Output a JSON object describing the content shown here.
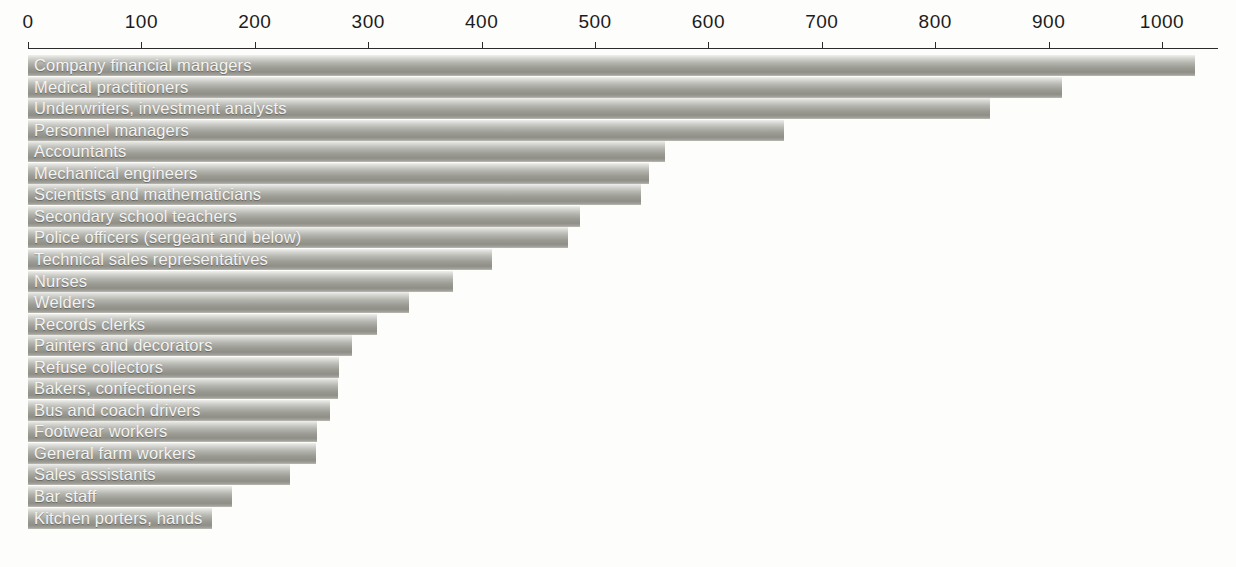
{
  "chart_data": {
    "type": "bar",
    "orientation": "horizontal",
    "title": "",
    "subtitle": "",
    "xlabel": "",
    "ylabel": "",
    "xlim": [
      0,
      1030
    ],
    "axis_ticks": [
      0,
      100,
      200,
      300,
      400,
      500,
      600,
      700,
      800,
      900,
      1000
    ],
    "tick_labels": [
      "0",
      "100",
      "200",
      "300",
      "400",
      "500",
      "600",
      "700",
      "800",
      "900",
      "1000"
    ],
    "grid": false,
    "legend": false,
    "legend_position": "none",
    "categories": [
      "Company financial managers",
      "Medical practitioners",
      "Underwriters, investment analysts",
      "Personnel managers",
      "Accountants",
      "Mechanical engineers",
      "Scientists and mathematicians",
      "Secondary school teachers",
      "Police officers (sergeant and below)",
      "Technical sales representatives",
      "Nurses",
      "Welders",
      "Records clerks",
      "Painters and decorators",
      "Refuse collectors",
      "Bakers, confectioners",
      "Bus and coach drivers",
      "Footwear workers",
      "General farm workers",
      "Sales assistants",
      "Bar staff",
      "Kitchen porters, hands"
    ],
    "values": [
      1029,
      912,
      848,
      667,
      562,
      548,
      541,
      487,
      476,
      409,
      375,
      336,
      308,
      286,
      274,
      273,
      266,
      255,
      254,
      231,
      180,
      162
    ]
  },
  "colors": {
    "background": "#fdfdfb",
    "bar_light": "#efefed",
    "bar_mid": "#b4b4ae",
    "bar_dark": "#8f8f88",
    "axis": "#2b2b2b",
    "tick_text": "#1c1c1c",
    "bar_label_text": "#f4f4f2"
  }
}
